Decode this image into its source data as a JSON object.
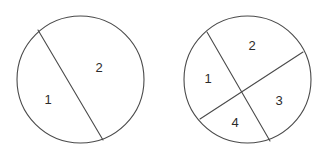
{
  "figure": {
    "width": 329,
    "height": 156,
    "background_color": "#ffffff",
    "stroke_color": "#4a4a4a",
    "label_color": "#2b2b2b"
  },
  "chart_data": {
    "type": "diagram",
    "xlabel": "",
    "ylabel": "",
    "categories": [
      "Circle A (1 chord)",
      "Circle B (2 chords)"
    ],
    "values": [
      2,
      4
    ],
    "series": [
      {
        "name": "Number of regions",
        "values": [
          2,
          4
        ]
      },
      {
        "name": "Number of chords",
        "values": [
          1,
          2
        ]
      }
    ],
    "annotations": [
      "1",
      "2",
      "1",
      "2",
      "3",
      "4"
    ],
    "grid": false,
    "legend": "none"
  },
  "shapes": {
    "circles": [
      {
        "name": "left-circle",
        "cx": 80.5,
        "cy": 79.5,
        "r": 63.5,
        "chords": [
          {
            "name": "left-chord",
            "x1": 38,
            "y1": 30,
            "x2": 103,
            "y2": 140
          }
        ],
        "labels": [
          {
            "name": "region-label-1",
            "text": "1",
            "x": 48,
            "y": 99
          },
          {
            "name": "region-label-2",
            "text": "2",
            "x": 99,
            "y": 67
          }
        ]
      },
      {
        "name": "right-circle",
        "cx": 247.5,
        "cy": 79.5,
        "r": 63.5,
        "chords": [
          {
            "name": "right-chord-a",
            "x1": 207,
            "y1": 32,
            "x2": 270,
            "y2": 141
          },
          {
            "name": "right-chord-b",
            "x1": 200,
            "y1": 119,
            "x2": 303,
            "y2": 52
          }
        ],
        "labels": [
          {
            "name": "region-label-1",
            "text": "1",
            "x": 208,
            "y": 78
          },
          {
            "name": "region-label-2",
            "text": "2",
            "x": 252,
            "y": 45
          },
          {
            "name": "region-label-3",
            "text": "3",
            "x": 279,
            "y": 100
          },
          {
            "name": "region-label-4",
            "text": "4",
            "x": 235,
            "y": 122
          }
        ]
      }
    ]
  },
  "labels": {
    "left_1": "1",
    "left_2": "2",
    "right_1": "1",
    "right_2": "2",
    "right_3": "3",
    "right_4": "4"
  }
}
